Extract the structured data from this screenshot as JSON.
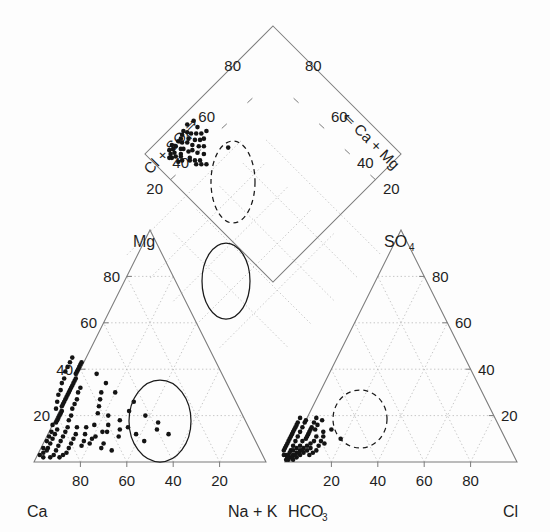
{
  "figure": {
    "type": "piper-trilinear-diagram",
    "title": "",
    "background_color": "#fdfdfd",
    "line_color": "#7b7b7b",
    "grid_color": "#b4b4b4",
    "point_color": "#141414",
    "annotation_color": "#1a1a1a"
  },
  "labels": {
    "cation_left_vertex": "Ca",
    "cation_right_vertex": "Na + K",
    "cation_top_vertex": "Mg",
    "anion_left_vertex": "HCO",
    "anion_left_vertex_sub": "3",
    "anion_right_vertex": "Cl",
    "anion_top_vertex": "SO",
    "anion_top_vertex_sub": "4",
    "diamond_left_axis_title": "Cl + SO",
    "diamond_left_axis_title_sub": "4",
    "diamond_left_axis_arrow": "⇒",
    "diamond_right_axis_title": "Ca + Mg",
    "diamond_right_axis_title_sub": "",
    "diamond_right_axis_arrow": "⇐"
  },
  "ticks": {
    "values": [
      20,
      40,
      60,
      80
    ],
    "cation_left_axis": [
      "20",
      "40",
      "60",
      "80"
    ],
    "cation_bottom_axis": [
      "80",
      "60",
      "40",
      "20"
    ],
    "anion_right_axis": [
      "20",
      "40",
      "60",
      "80"
    ],
    "anion_bottom_axis": [
      "20",
      "40",
      "60",
      "80"
    ],
    "diamond_left_axis": [
      "20",
      "40",
      "60",
      "80"
    ],
    "diamond_right_axis": [
      "20",
      "40",
      "60",
      "80"
    ]
  },
  "chart_data": {
    "type": "scatter",
    "title": "",
    "xlabel": "",
    "ylabel": "",
    "subplots": [
      {
        "name": "cation-triangle",
        "axes": [
          "Ca",
          "Mg",
          "Na + K"
        ],
        "axis_range": [
          0,
          100
        ],
        "grid": true,
        "points_ca_mg": [
          [
            96,
            3
          ],
          [
            93,
            6
          ],
          [
            90,
            9
          ],
          [
            88,
            11
          ],
          [
            86,
            13
          ],
          [
            84,
            16
          ],
          [
            82,
            17
          ],
          [
            80,
            19
          ],
          [
            79,
            20
          ],
          [
            78,
            21
          ],
          [
            77,
            22
          ],
          [
            76,
            24
          ],
          [
            75,
            25
          ],
          [
            74,
            26
          ],
          [
            73,
            27
          ],
          [
            72,
            28
          ],
          [
            71,
            29
          ],
          [
            70,
            30
          ],
          [
            69,
            31
          ],
          [
            68,
            32
          ],
          [
            67,
            33
          ],
          [
            66,
            34
          ],
          [
            65,
            35
          ],
          [
            64,
            36
          ],
          [
            63,
            38
          ],
          [
            62,
            39
          ],
          [
            61,
            40
          ],
          [
            60,
            41
          ],
          [
            59,
            42
          ],
          [
            58,
            43
          ],
          [
            83,
            14
          ],
          [
            85,
            12
          ],
          [
            87,
            10
          ],
          [
            89,
            8
          ],
          [
            91,
            6
          ],
          [
            92,
            5
          ],
          [
            94,
            4
          ],
          [
            95,
            2
          ],
          [
            81,
            18
          ],
          [
            79,
            23
          ],
          [
            77,
            26
          ],
          [
            75,
            29
          ],
          [
            73,
            31
          ],
          [
            71,
            34
          ],
          [
            69,
            36
          ],
          [
            67,
            39
          ],
          [
            65,
            41
          ],
          [
            63,
            43
          ],
          [
            61,
            45
          ],
          [
            76,
            18
          ],
          [
            74,
            20
          ],
          [
            72,
            23
          ],
          [
            70,
            25
          ],
          [
            68,
            27
          ],
          [
            66,
            30
          ],
          [
            64,
            32
          ],
          [
            84,
            9
          ],
          [
            82,
            11
          ],
          [
            80,
            13
          ],
          [
            86,
            7
          ],
          [
            88,
            5
          ],
          [
            90,
            3
          ],
          [
            92,
            2
          ],
          [
            78,
            15
          ],
          [
            76,
            12
          ],
          [
            74,
            15
          ],
          [
            72,
            12
          ],
          [
            70,
            15
          ],
          [
            68,
            11
          ],
          [
            66,
            16
          ],
          [
            64,
            13
          ],
          [
            80,
            8
          ],
          [
            78,
            10
          ],
          [
            76,
            7
          ],
          [
            74,
            9
          ],
          [
            82,
            6
          ],
          [
            84,
            4
          ],
          [
            86,
            3
          ],
          [
            88,
            2
          ],
          [
            72,
            8
          ],
          [
            70,
            10
          ],
          [
            68,
            6
          ],
          [
            66,
            8
          ],
          [
            64,
            5
          ],
          [
            62,
            21
          ],
          [
            60,
            24
          ],
          [
            58,
            27
          ],
          [
            56,
            30
          ],
          [
            62,
            13
          ],
          [
            60,
            16
          ],
          [
            58,
            11
          ],
          [
            56,
            14
          ],
          [
            54,
            38
          ],
          [
            52,
            34
          ],
          [
            50,
            30
          ],
          [
            58,
            20
          ],
          [
            48,
            22
          ],
          [
            44,
            26
          ],
          [
            42,
            20
          ],
          [
            40,
            14
          ],
          [
            38,
            17
          ],
          [
            36,
            12
          ],
          [
            54,
            18
          ],
          [
            52,
            15
          ],
          [
            50,
            12
          ],
          [
            48,
            9
          ]
        ],
        "ellipse_groups": [
          {
            "style": "solid",
            "center_ca": 48,
            "center_mg": 20,
            "label": "cation-group-solid"
          }
        ]
      },
      {
        "name": "anion-triangle",
        "axes": [
          "HCO3",
          "SO4",
          "Cl"
        ],
        "axis_range": [
          0,
          100
        ],
        "grid": true,
        "points_hco3_so4": [
          [
            97,
            2
          ],
          [
            95,
            3
          ],
          [
            93,
            4
          ],
          [
            91,
            5
          ],
          [
            89,
            6
          ],
          [
            87,
            7
          ],
          [
            96,
            1
          ],
          [
            94,
            2
          ],
          [
            92,
            3
          ],
          [
            90,
            4
          ],
          [
            88,
            5
          ],
          [
            86,
            6
          ],
          [
            98,
            1
          ],
          [
            97,
            3
          ],
          [
            95,
            5
          ],
          [
            93,
            7
          ],
          [
            91,
            9
          ],
          [
            89,
            11
          ],
          [
            87,
            13
          ],
          [
            85,
            8
          ],
          [
            83,
            9
          ],
          [
            81,
            11
          ],
          [
            85,
            15
          ],
          [
            83,
            17
          ],
          [
            86,
            10
          ],
          [
            84,
            12
          ],
          [
            82,
            14
          ],
          [
            88,
            9
          ],
          [
            90,
            7
          ],
          [
            92,
            6
          ],
          [
            94,
            5
          ],
          [
            96,
            4
          ],
          [
            98,
            3
          ],
          [
            99,
            1
          ],
          [
            98,
            2
          ],
          [
            96,
            2
          ],
          [
            94,
            3
          ],
          [
            92,
            4
          ],
          [
            90,
            5
          ],
          [
            88,
            3
          ],
          [
            86,
            4
          ],
          [
            84,
            5
          ],
          [
            82,
            7
          ],
          [
            80,
            9
          ],
          [
            78,
            11
          ],
          [
            80,
            14
          ],
          [
            78,
            16
          ],
          [
            82,
            18
          ],
          [
            84,
            19
          ],
          [
            86,
            17
          ],
          [
            88,
            15
          ],
          [
            90,
            13
          ],
          [
            92,
            11
          ],
          [
            94,
            9
          ],
          [
            96,
            7
          ],
          [
            98,
            5
          ],
          [
            99,
            3
          ],
          [
            97,
            6
          ],
          [
            95,
            8
          ],
          [
            93,
            10
          ],
          [
            91,
            12
          ],
          [
            89,
            14
          ],
          [
            87,
            16
          ],
          [
            85,
            11
          ],
          [
            83,
            13
          ],
          [
            81,
            15
          ],
          [
            79,
            8
          ],
          [
            77,
            13
          ],
          [
            75,
            18
          ],
          [
            73,
            14
          ],
          [
            71,
            10
          ],
          [
            79,
            17
          ],
          [
            77,
            19
          ]
        ],
        "ellipse_groups": [
          {
            "style": "dashed",
            "center_hco3": 64,
            "center_so4": 16,
            "label": "anion-group-dashed"
          }
        ]
      },
      {
        "name": "diamond",
        "axes": [
          "Cl + SO4",
          "Ca + Mg"
        ],
        "axis_range": [
          0,
          100
        ],
        "grid": true,
        "points_x_y": [
          [
            14,
            14
          ],
          [
            16,
            12
          ],
          [
            18,
            16
          ],
          [
            12,
            11
          ],
          [
            15,
            9
          ],
          [
            17,
            13
          ],
          [
            19,
            10
          ],
          [
            13,
            15
          ],
          [
            20,
            17
          ],
          [
            21,
            12
          ],
          [
            11,
            13
          ],
          [
            10,
            10
          ],
          [
            16,
            19
          ],
          [
            18,
            8
          ],
          [
            22,
            15
          ],
          [
            23,
            11
          ],
          [
            24,
            18
          ],
          [
            14,
            7
          ],
          [
            12,
            17
          ],
          [
            9,
            12
          ],
          [
            20,
            8
          ],
          [
            25,
            14
          ],
          [
            26,
            10
          ],
          [
            27,
            16
          ],
          [
            15,
            20
          ],
          [
            17,
            22
          ],
          [
            19,
            24
          ],
          [
            13,
            9
          ],
          [
            11,
            8
          ],
          [
            8,
            11
          ],
          [
            28,
            12
          ],
          [
            29,
            17
          ],
          [
            21,
            20
          ],
          [
            23,
            23
          ],
          [
            25,
            8
          ],
          [
            30,
            14
          ],
          [
            10,
            16
          ],
          [
            22,
            7
          ],
          [
            26,
            20
          ],
          [
            24,
            6
          ],
          [
            31,
            10
          ],
          [
            33,
            15
          ],
          [
            18,
            26
          ],
          [
            20,
            28
          ],
          [
            16,
            24
          ],
          [
            35,
            30
          ],
          [
            32,
            6
          ],
          [
            28,
            5
          ]
        ],
        "ellipse_groups": [
          {
            "style": "dashed",
            "center_x": 38,
            "center_y": 40,
            "label": "diamond-group-dashed"
          },
          {
            "style": "solid",
            "center_x": 36,
            "center_y": 18,
            "label": "diamond-group-solid"
          }
        ]
      }
    ]
  }
}
